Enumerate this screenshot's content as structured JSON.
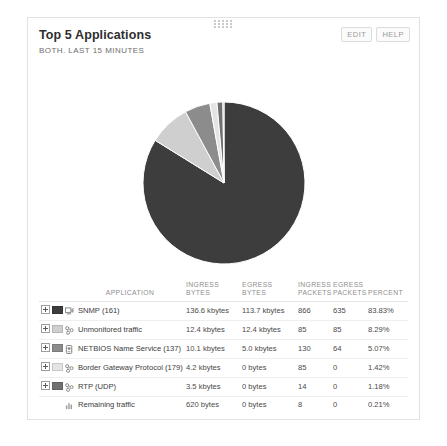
{
  "widget": {
    "title": "Top 5 Applications",
    "subtitle": "BOTH. LAST 15 MINUTES",
    "drag_handle_icon": "drag-dots-icon",
    "actions": [
      {
        "label": "EDIT",
        "name": "edit-button"
      },
      {
        "label": "HELP",
        "name": "help-button"
      }
    ]
  },
  "table": {
    "headers": {
      "application": "APPLICATION",
      "ingress_bytes": "INGRESS BYTES",
      "egress_bytes": "EGRESS BYTES",
      "ingress_packets": "INGRESS PACKETS",
      "egress_packets": "EGRESS PACKETS",
      "percent": "PERCENT"
    },
    "rows": [
      {
        "expandable": true,
        "swatch": "#3d3d3d",
        "icon": "snmp-icon",
        "name": "SNMP (161)",
        "ingress_bytes": "136.6 kbytes",
        "egress_bytes": "113.7 kbytes",
        "ingress_packets": "866",
        "egress_packets": "635",
        "percent": "83.83%"
      },
      {
        "expandable": true,
        "swatch": "#cfcfcf",
        "icon": "network-icon",
        "name": "Unmonitored traffic",
        "ingress_bytes": "12.4 kbytes",
        "egress_bytes": "12.4 kbytes",
        "ingress_packets": "85",
        "egress_packets": "85",
        "percent": "8.29%"
      },
      {
        "expandable": true,
        "swatch": "#8c8c8c",
        "icon": "netbios-icon",
        "name": "NETBIOS Name Service (137)",
        "ingress_bytes": "10.1 kbytes",
        "egress_bytes": "5.0 kbytes",
        "ingress_packets": "130",
        "egress_packets": "64",
        "percent": "5.07%"
      },
      {
        "expandable": true,
        "swatch": "#e4e4e4",
        "icon": "network-icon",
        "name": "Border Gateway Protocol (179)",
        "ingress_bytes": "4.2 kbytes",
        "egress_bytes": "0 bytes",
        "ingress_packets": "85",
        "egress_packets": "0",
        "percent": "1.42%"
      },
      {
        "expandable": true,
        "swatch": "#707070",
        "icon": "network-icon",
        "name": "RTP (UDP)",
        "ingress_bytes": "3.5 kbytes",
        "egress_bytes": "0 bytes",
        "ingress_packets": "14",
        "egress_packets": "0",
        "percent": "1.18%"
      },
      {
        "expandable": false,
        "swatch": null,
        "icon": "chart-bars-icon",
        "name": "Remaining traffic",
        "ingress_bytes": "620 bytes",
        "egress_bytes": "0 bytes",
        "ingress_packets": "8",
        "egress_packets": "0",
        "percent": "0.21%"
      }
    ]
  },
  "chart_data": {
    "type": "pie",
    "title": "Top 5 Applications",
    "subtitle": "BOTH. LAST 15 MINUTES",
    "unit": "percent",
    "legend": "table",
    "start_angle_deg": -90,
    "categories": [
      "SNMP (161)",
      "Unmonitored traffic",
      "NETBIOS Name Service (137)",
      "Border Gateway Protocol (179)",
      "RTP (UDP)",
      "Remaining traffic"
    ],
    "values": [
      83.83,
      8.29,
      5.07,
      1.42,
      1.18,
      0.21
    ],
    "colors": [
      "#3d3d3d",
      "#cfcfcf",
      "#8c8c8c",
      "#e4e4e4",
      "#707070",
      "#a8a8a8"
    ]
  }
}
